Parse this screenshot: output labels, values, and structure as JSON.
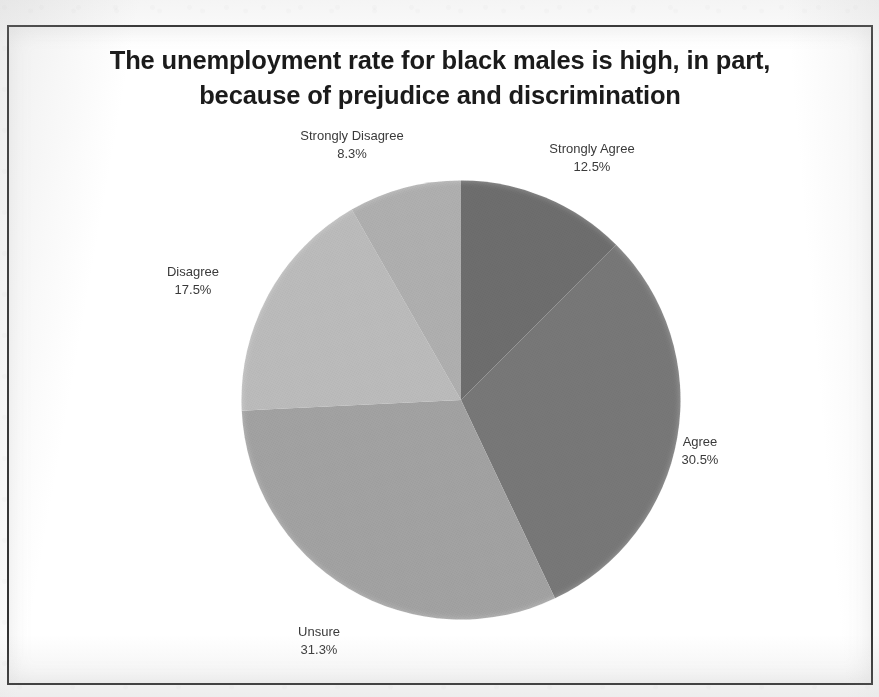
{
  "chart_data": {
    "type": "pie",
    "title": "The unemployment rate for black males is high, in part, because of prejudice and discrimination",
    "title_line1": "The unemployment rate for black males is high, in part,",
    "title_line2": "because of prejudice and discrimination",
    "xlabel": "",
    "ylabel": "",
    "legend": "none",
    "grid": false,
    "labels_show_name_and_percent": true,
    "start_angle_deg": 0,
    "direction": "clockwise",
    "categories": [
      "Strongly Agree",
      "Agree",
      "Unsure",
      "Disagree",
      "Strongly Disagree"
    ],
    "values": [
      12.5,
      30.5,
      31.3,
      17.5,
      8.3
    ],
    "value_unit": "percent",
    "slices": [
      {
        "label": "Strongly Agree",
        "percent_text": "12.5%",
        "value": 12.5,
        "color": "#6e6e6e"
      },
      {
        "label": "Agree",
        "percent_text": "30.5%",
        "value": 30.5,
        "color": "#787878"
      },
      {
        "label": "Unsure",
        "percent_text": "31.3%",
        "value": 31.3,
        "color": "#a3a3a3"
      },
      {
        "label": "Disagree",
        "percent_text": "17.5%",
        "value": 17.5,
        "color": "#bcbcbc"
      },
      {
        "label": "Strongly Disagree",
        "percent_text": "8.3%",
        "value": 8.3,
        "color": "#b0b0b0"
      }
    ]
  },
  "frame": {
    "border_color": "#2e2e2e",
    "background": "#ffffff"
  }
}
